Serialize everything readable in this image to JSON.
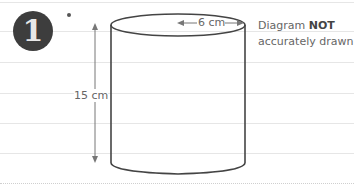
{
  "question": {
    "number": "1",
    "marker": "*"
  },
  "diagram": {
    "shape": "cylinder",
    "radius_label": "6 cm",
    "height_label": "15 cm"
  },
  "note": {
    "prefix": "Diagram",
    "emphasis": "NOT",
    "suffix": "accurately drawn"
  }
}
